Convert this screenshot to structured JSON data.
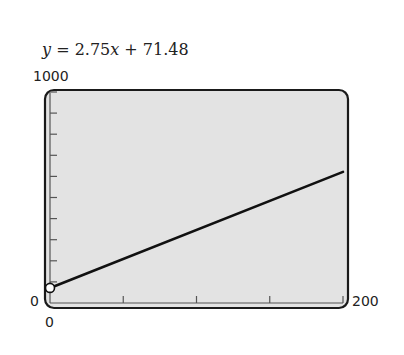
{
  "equation": {
    "lhs": "y",
    "eq": " = 2.75",
    "x": "x",
    "rest": " + 71.48",
    "full": "y = 2.75x + 71.48"
  },
  "axis_labels": {
    "ymax": "1000",
    "ymin": "0",
    "xmin": "0",
    "xmax": "200"
  },
  "colors": {
    "plot_bg": "#e3e3e3",
    "frame": "#1a1a1a",
    "line": "#111111",
    "point_fill": "#ffffff"
  },
  "chart_data": {
    "type": "line",
    "title": "y = 2.75x + 71.48",
    "xlabel": "",
    "ylabel": "",
    "xlim": [
      0,
      200
    ],
    "ylim": [
      0,
      1000
    ],
    "x_ticks": [
      0,
      50,
      100,
      150,
      200
    ],
    "y_ticks": [
      0,
      100,
      200,
      300,
      400,
      500,
      600,
      700,
      800,
      900,
      1000
    ],
    "x_tick_labels_shown": [
      "0",
      "200"
    ],
    "y_tick_labels_shown": [
      "0",
      "1000"
    ],
    "grid": false,
    "legend": null,
    "series": [
      {
        "name": "y = 2.75x + 71.48",
        "slope": 2.75,
        "intercept": 71.48,
        "x": [
          0,
          200
        ],
        "values": [
          71.48,
          621.48
        ]
      }
    ],
    "annotations": [
      {
        "type": "open-circle-point",
        "x": 0,
        "y": 71.48
      }
    ]
  }
}
